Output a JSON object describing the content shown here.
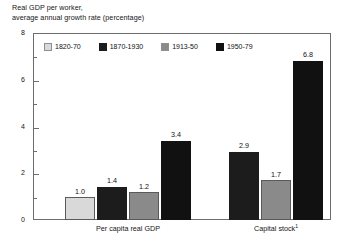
{
  "chart_data": {
    "type": "bar",
    "title_line1": "Real GDP per worker,",
    "title_line2": "average annual growth rate (percentage)",
    "xlabel": "",
    "ylabel": "",
    "ylim": [
      0,
      8
    ],
    "grid": false,
    "legend_position": "top-left-inside",
    "y_ticks_major": [
      "0",
      "2",
      "4",
      "6",
      "8"
    ],
    "y_tick_values_major": [
      0,
      2,
      4,
      6,
      8
    ],
    "y_tick_values_minor": [
      1,
      3,
      5,
      7
    ],
    "categories": [
      "Per capita real GDP",
      "Capital stock"
    ],
    "category_labels": [
      {
        "text": "Per capita real GDP",
        "footnote": ""
      },
      {
        "text": "Capital stock",
        "footnote": "1"
      }
    ],
    "series": [
      {
        "name": "1820-70",
        "color": "#d9d9d9",
        "values": [
          1.0,
          null
        ],
        "value_labels": [
          "1.0",
          ""
        ]
      },
      {
        "name": "1870-1930",
        "color": "#1c1c1c",
        "values": [
          1.4,
          2.9
        ],
        "value_labels": [
          "1.4",
          "2.9"
        ]
      },
      {
        "name": "1913-50",
        "color": "#8a8a8a",
        "values": [
          1.2,
          1.7
        ],
        "value_labels": [
          "1.2",
          "1.7"
        ]
      },
      {
        "name": "1950-79",
        "color": "#111111",
        "values": [
          3.4,
          6.8
        ],
        "value_labels": [
          "3.4",
          "6.8"
        ]
      }
    ],
    "annotations": []
  },
  "colors": {
    "background": "#ffffff",
    "axis": "#6d6d6d",
    "text": "#151515",
    "series_1820_70": "#d9d9d9",
    "series_1870_1930": "#1c1c1c",
    "series_1913_50": "#8a8a8a",
    "series_1950_79": "#111111"
  }
}
